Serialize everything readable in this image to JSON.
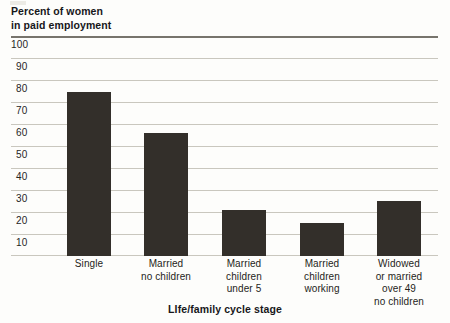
{
  "chart_data": {
    "type": "bar",
    "title": "Percent of women in paid employment",
    "title_lines": [
      "Percent of women",
      "in paid employment"
    ],
    "xlabel": "LIfe/family cycle stage",
    "ylabel": "Percent of women in paid employment",
    "categories": [
      "Single",
      "Married no children",
      "Married children under 5",
      "Married children working",
      "Widowed or married over 49 no children"
    ],
    "category_lines": [
      [
        "Single"
      ],
      [
        "Married",
        "no children"
      ],
      [
        "Married",
        "children",
        "under 5"
      ],
      [
        "Married",
        "children",
        "working"
      ],
      [
        "Widowed",
        "or married",
        "over 49",
        "no children"
      ]
    ],
    "values": [
      75,
      56,
      21,
      15,
      25
    ],
    "ylim": [
      0,
      100
    ],
    "yticks": [
      100,
      90,
      80,
      70,
      60,
      50,
      40,
      30,
      20,
      10
    ],
    "ytick_labels": [
      "100",
      "90",
      "80",
      "70",
      "60",
      "50",
      "40",
      "30",
      "20",
      "10"
    ],
    "grid": true,
    "legend": null,
    "bar_color": "#332f2a",
    "gridline_color": "#c9c7be",
    "top_rule_color": "#77746c",
    "background_color": "#fdfdfb"
  }
}
